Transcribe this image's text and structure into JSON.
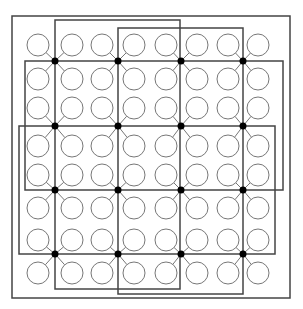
{
  "diagram": {
    "title": "",
    "colors": {
      "line": "#444444",
      "circle": "#777777",
      "node": "#000000",
      "background": "#ffffff"
    },
    "columns_x": [
      38,
      72,
      102,
      134,
      166,
      197,
      228,
      258
    ],
    "rows_y": [
      45,
      79,
      108,
      146,
      175,
      208,
      240,
      273
    ],
    "circle_radius": 11,
    "nodes": {
      "x": [
        55,
        118,
        181,
        243
      ],
      "y": [
        61,
        126,
        190,
        254
      ]
    },
    "rectangles": [
      {
        "name": "outer-border",
        "x": 12,
        "y": 16,
        "w": 278,
        "h": 282
      },
      {
        "name": "tall-rect-left",
        "x": 55,
        "y": 20,
        "w": 125,
        "h": 269
      },
      {
        "name": "tall-rect-right",
        "x": 118,
        "y": 28,
        "w": 125,
        "h": 266
      },
      {
        "name": "band-top",
        "x": 25,
        "y": 61,
        "w": 258,
        "h": 129
      },
      {
        "name": "band-bottom",
        "x": 19,
        "y": 126,
        "w": 256,
        "h": 128
      }
    ]
  }
}
